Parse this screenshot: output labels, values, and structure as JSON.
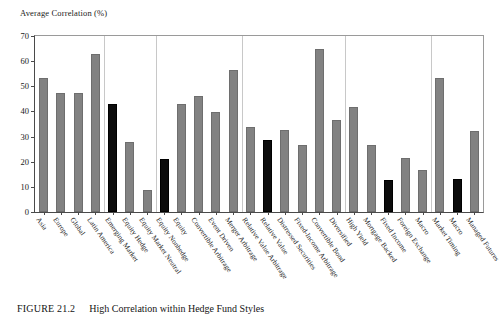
{
  "figure": {
    "caption_label": "FIGURE 21.2",
    "caption_text": "High Correlation within Hedge Fund Styles"
  },
  "chart_data": {
    "type": "bar",
    "title": "",
    "ylabel": "Average Correlation (%)",
    "xlabel": "",
    "ylim": [
      0,
      70
    ],
    "yticks": [
      0,
      10,
      20,
      30,
      40,
      50,
      60,
      70
    ],
    "ytick_labels": [
      "0",
      "10",
      "20",
      "30",
      "40",
      "50",
      "60",
      "70"
    ],
    "grid": false,
    "legend": "none",
    "bar_color": "#828282",
    "highlight_color": "#0c0c0c",
    "group_separators_after": [
      3,
      6,
      11,
      17,
      22
    ],
    "categories": [
      "Asia",
      "Europe",
      "Global",
      "Latin America",
      "Emerging Market",
      "Equity Hedge",
      "Equity Market Neutral",
      "Equity Nonhedge",
      "Equity",
      "Convertible Arbitrage",
      "Event Driven",
      "Merger Arbitrage",
      "Relative Value Arbitrage",
      "Relative Value",
      "Distressed Securities",
      "Fixed-Income Arbitrage",
      "Convertible Bond",
      "Diversified",
      "High Yield",
      "Mortgage Backed",
      "Fixed Income",
      "Foreign Exchange",
      "Macro",
      "Market Timing",
      "Macro",
      "Managed Futures"
    ],
    "values": [
      53.5,
      47.2,
      47.2,
      62.8,
      43.0,
      28.0,
      8.8,
      21.2,
      43.0,
      46.2,
      39.8,
      56.4,
      34.0,
      28.8,
      32.8,
      26.5,
      64.8,
      36.5,
      41.8,
      26.6,
      12.6,
      21.5,
      16.8,
      53.5,
      13.0,
      32.3
    ],
    "highlighted": [
      false,
      false,
      false,
      false,
      true,
      false,
      false,
      true,
      false,
      false,
      false,
      false,
      false,
      true,
      false,
      false,
      false,
      false,
      false,
      false,
      true,
      false,
      false,
      false,
      true,
      false
    ]
  }
}
